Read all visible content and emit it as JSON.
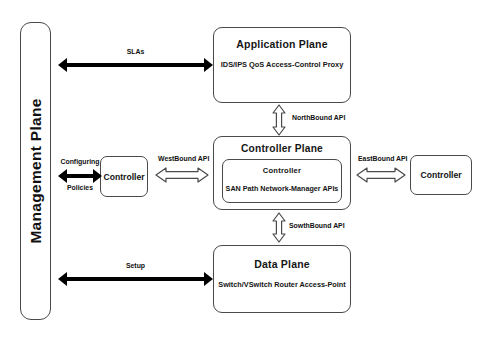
{
  "diagram": {
    "background": "#ffffff",
    "stroke_color": "#4a4a4a",
    "arrow_color": "#000000"
  },
  "management_plane": {
    "label": "Management Plane"
  },
  "application_plane": {
    "title": "Application Plane",
    "items_text": "IDS/IPS   QoS   Access-Control   Proxy",
    "items": [
      "IDS/IPS",
      "QoS",
      "Access-Control",
      "Proxy"
    ]
  },
  "controller_plane": {
    "title": "Controller Plane",
    "inner": {
      "title": "Controller",
      "items_text": "SAN   Path   Network-Manager   APIs",
      "items": [
        "SAN",
        "Path",
        "Network-Manager",
        "APIs"
      ]
    }
  },
  "data_plane": {
    "title": "Data Plane",
    "items_text": "Switch/VSwitch   Router   Access-Point",
    "items": [
      "Switch/VSwitch",
      "Router",
      "Access-Point"
    ]
  },
  "peer_controllers": {
    "west": {
      "label": "Controller"
    },
    "east": {
      "label": "Controller"
    }
  },
  "connections": {
    "slas": {
      "label": "SLAs",
      "style": "solid-double-arrow"
    },
    "configuring": {
      "label_top": "Configuring",
      "label_bottom": "Policies",
      "style": "solid-double-arrow"
    },
    "setup": {
      "label": "Setup",
      "style": "solid-double-arrow"
    },
    "northbound": {
      "label": "NorthBound API",
      "style": "hollow-double-arrow-vertical"
    },
    "southbound": {
      "label": "SowthBound API",
      "style": "hollow-double-arrow-vertical"
    },
    "westbound": {
      "label": "WestBound API",
      "style": "hollow-double-arrow-horizontal"
    },
    "eastbound": {
      "label": "EastBound API",
      "style": "hollow-double-arrow-horizontal"
    }
  }
}
